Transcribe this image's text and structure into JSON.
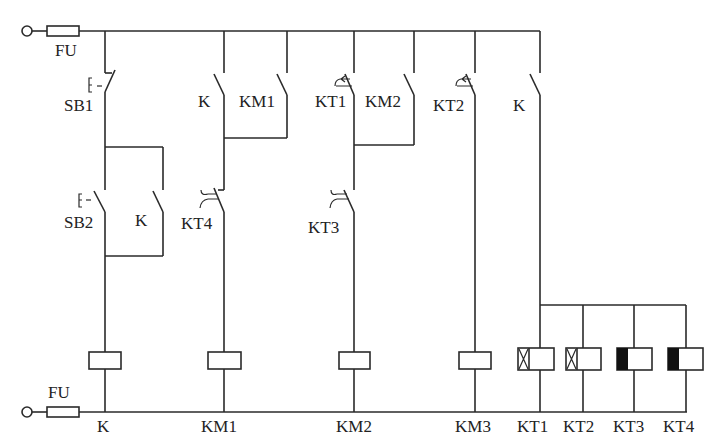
{
  "diagram": {
    "type": "relay-control-circuit",
    "fuse_top_label": "FU",
    "fuse_bottom_label": "FU",
    "contacts": {
      "sb1": "SB1",
      "sb2": "SB2",
      "k_hold": "K",
      "k_km1": "K",
      "km1_hold": "KM1",
      "kt4_break": "KT4",
      "kt1_break": "KT1",
      "km2_hold": "KM2",
      "kt3_break": "KT3",
      "kt2_break": "KT2",
      "k_timers": "K"
    },
    "coils": [
      {
        "label": "K",
        "kind": "relay"
      },
      {
        "label": "KM1",
        "kind": "contactor"
      },
      {
        "label": "KM2",
        "kind": "contactor"
      },
      {
        "label": "KM3",
        "kind": "contactor"
      },
      {
        "label": "KT1",
        "kind": "on-delay-timer"
      },
      {
        "label": "KT2",
        "kind": "on-delay-timer"
      },
      {
        "label": "KT3",
        "kind": "off-delay-timer"
      },
      {
        "label": "KT4",
        "kind": "off-delay-timer"
      }
    ]
  }
}
